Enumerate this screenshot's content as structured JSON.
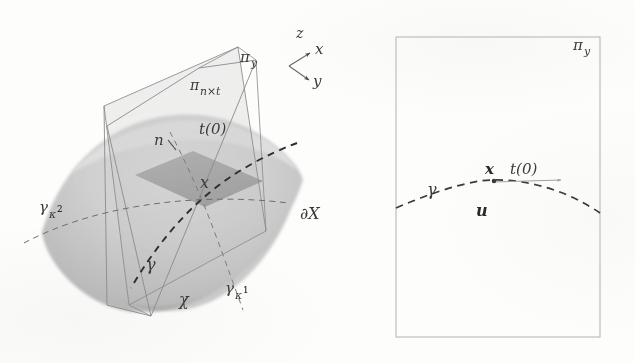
{
  "figure": {
    "panels": [
      {
        "id": "left-panel-3d",
        "name": "three-dimensional-surface-patch",
        "labels": {
          "plane_y": "π",
          "plane_y_sub": "y",
          "plane_nt": "π",
          "plane_nt_sub": "n×t",
          "normal": "n",
          "tangent": "t(0)",
          "point": "x",
          "boundary": "∂X",
          "geodesic": "γ",
          "geodesic_k1": "γ",
          "geodesic_k1_sub": "κ",
          "geodesic_k1_exp": "1",
          "geodesic_k2": "γ",
          "geodesic_k2_sub": "κ",
          "geodesic_k2_exp": "2",
          "chi": "χ"
        },
        "axes": {
          "z": "z",
          "x": "x",
          "y": "y"
        }
      },
      {
        "id": "right-panel-2d",
        "name": "two-dimensional-normal-section",
        "labels": {
          "plane_y": "π",
          "plane_y_sub": "y",
          "geodesic": "γ",
          "point": "x",
          "tangent": "t(0)",
          "direction": "u"
        }
      }
    ],
    "colors": {
      "ink": "#3a3a3a",
      "ink_dark": "#2b2b2b",
      "surface_light": "#d8d8d8",
      "surface_mid": "#c2c2c2",
      "surface_dark": "#a8a8a8",
      "patch_fill": "#9a9a9a",
      "plane_stroke": "#8a8a8a",
      "frame_stroke": "#b5b5b5",
      "paper": "#fdfdfc"
    }
  }
}
